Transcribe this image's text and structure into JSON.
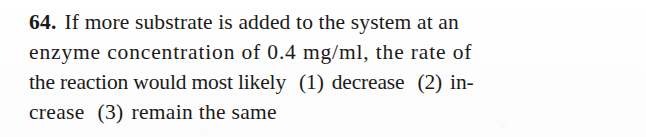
{
  "document": {
    "type": "exam-question",
    "background_color": "#fefefe",
    "text_color": "#1c1a19",
    "question_number": "64.",
    "question_text": "If more substrate is added to the system at an enzyme concentration of 0.4 mg/ml, the rate of the reaction would most likely",
    "lines": [
      {
        "id": "line-1",
        "text": "If more substrate is added to the system at an"
      },
      {
        "id": "line-2",
        "text": "enzyme concentration of 0.4 mg/ml, the rate of"
      },
      {
        "id": "line-3",
        "prompt_tail": "the reaction would most likely"
      },
      {
        "id": "line-4",
        "continuation": "crease"
      }
    ],
    "choices": [
      {
        "marker": "(1)",
        "label_part_1": "decrease",
        "label": "decrease"
      },
      {
        "marker": "(2)",
        "label_part_1": "in-",
        "label": "increase"
      },
      {
        "marker": "(3)",
        "label_part_1": "remain the same",
        "label": "remain the same"
      }
    ]
  }
}
